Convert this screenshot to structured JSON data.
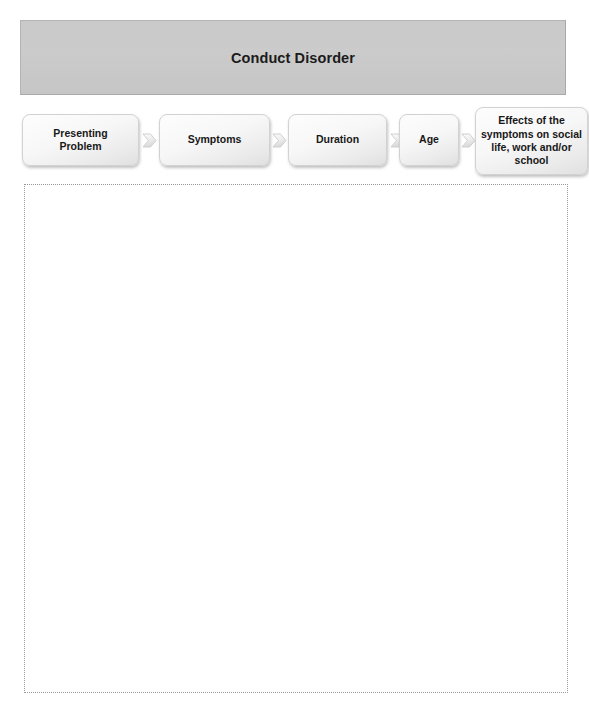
{
  "banner": {
    "title": "Conduct Disorder"
  },
  "flow": {
    "nodes": [
      {
        "label": "Presenting\nProblem"
      },
      {
        "label": "Symptoms"
      },
      {
        "label": "Duration"
      },
      {
        "label": "Age"
      },
      {
        "label": "Effects of the\nsymptoms  on social\nlife, work and/or\nschool"
      }
    ],
    "arrows": [
      {
        "icon": "chevron-right-icon"
      },
      {
        "icon": "chevron-right-icon"
      },
      {
        "icon": "chevron-right-icon"
      },
      {
        "icon": "chevron-right-icon"
      }
    ]
  },
  "content_area": {
    "text": ""
  },
  "colors": {
    "banner_fill": "#c9c9c9",
    "banner_border": "#b4b4b4",
    "node_fill": "#f7f7f7",
    "node_border": "#d2d2d2",
    "text": "#181818",
    "dotted_border": "#9a9a9a"
  }
}
